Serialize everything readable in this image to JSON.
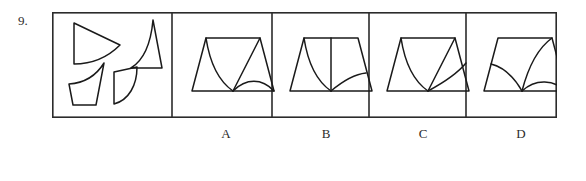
{
  "question": {
    "number": "9.",
    "type": "shape-assembly-visual-reasoning"
  },
  "colors": {
    "ink": "#1a1a1a",
    "frame": "#2b2b2b",
    "background": "#ffffff"
  },
  "panels": [
    {
      "id": "stimulus",
      "label": "",
      "role": "pieces"
    },
    {
      "id": "option-a",
      "label": "A",
      "role": "answer-option"
    },
    {
      "id": "option-b",
      "label": "B",
      "role": "answer-option"
    },
    {
      "id": "option-c",
      "label": "C",
      "role": "answer-option"
    },
    {
      "id": "option-d",
      "label": "D",
      "role": "answer-option"
    }
  ],
  "option_labels": [
    "A",
    "B",
    "C",
    "D"
  ],
  "stimulus_pieces": [
    {
      "name": "wedge-with-concave-base",
      "position": "top-left"
    },
    {
      "name": "concave-sided-spike-triangle",
      "position": "top-right"
    },
    {
      "name": "curved-top-quadrilateral",
      "position": "bottom-left"
    },
    {
      "name": "quarter-disc-sector",
      "position": "bottom-right"
    }
  ],
  "figure_geometry": {
    "frame": {
      "x": 0.5,
      "y": 0.5,
      "width": 504,
      "height": 105
    },
    "dividers_x": [
      120,
      220,
      317,
      414
    ],
    "trapezoid": {
      "top_left_x": 22,
      "top_right_x": 76,
      "bottom_left_x": 8,
      "bottom_right_x": 90,
      "top_y": 26,
      "bottom_y": 79
    }
  }
}
